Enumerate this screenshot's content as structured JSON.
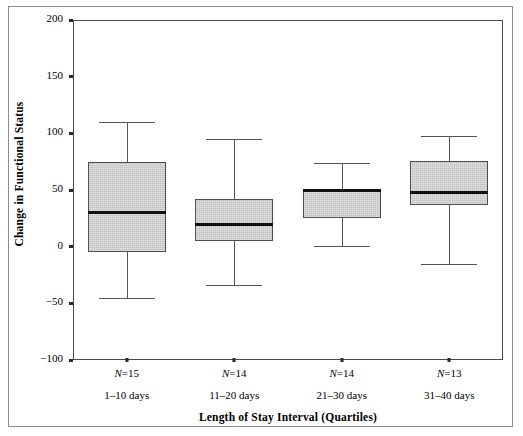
{
  "chart_data": {
    "type": "box",
    "title": "",
    "xlabel": "Length of Stay Interval (Quartiles)",
    "ylabel": "Change in Functional Status",
    "ylim": [
      -100,
      200
    ],
    "yticks": [
      200,
      150,
      100,
      50,
      0,
      -50,
      -100
    ],
    "ytick_labels": [
      "200",
      "150",
      "100",
      "50",
      "0",
      "−50",
      "−100"
    ],
    "grid": false,
    "legend": "none",
    "categories": [
      "1–10 days",
      "11–20 days",
      "21–30 days",
      "31–40 days"
    ],
    "counts": [
      "N=15",
      "N=14",
      "N=14",
      "N=13"
    ],
    "boxes": [
      {
        "category": "1–10 days",
        "n": 15,
        "whisker_low": -45,
        "q1": -5,
        "median": 30,
        "q3": 75,
        "whisker_high": 110
      },
      {
        "category": "11–20 days",
        "n": 14,
        "whisker_low": -34,
        "q1": 5,
        "median": 20,
        "q3": 42,
        "whisker_high": 95
      },
      {
        "category": "21–30 days",
        "n": 14,
        "whisker_low": 1,
        "q1": 25,
        "median": 50,
        "q3": 51,
        "whisker_high": 74
      },
      {
        "category": "31–40 days",
        "n": 13,
        "whisker_low": -15,
        "q1": 37,
        "median": 48,
        "q3": 76,
        "whisker_high": 98
      }
    ],
    "colors": {
      "box_fill": "#c2c2c2",
      "box_edge": "#4f4f4f",
      "median": "#111111",
      "whisker": "#555555",
      "axis": "#4a4a4a",
      "frame": "#8d8d8d",
      "background": "#ffffff"
    }
  },
  "axes": {
    "y": {
      "label": "Change in Functional Status",
      "ticks": [
        {
          "value": 200,
          "label": "200"
        },
        {
          "value": 150,
          "label": "150"
        },
        {
          "value": 100,
          "label": "100"
        },
        {
          "value": 50,
          "label": "50"
        },
        {
          "value": 0,
          "label": "0"
        },
        {
          "value": -50,
          "label": "−50"
        },
        {
          "value": -100,
          "label": "−100"
        }
      ]
    },
    "x": {
      "label": "Length of Stay Interval (Quartiles)",
      "groups": [
        {
          "n_label": "N=15",
          "range_label": "1–10 days"
        },
        {
          "n_label": "N=14",
          "range_label": "11–20 days"
        },
        {
          "n_label": "N=14",
          "range_label": "21–30 days"
        },
        {
          "n_label": "N=13",
          "range_label": "31–40 days"
        }
      ]
    }
  }
}
